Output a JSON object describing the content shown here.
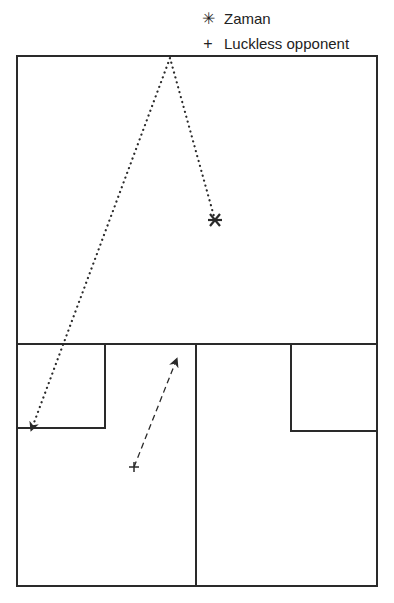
{
  "legend": {
    "items": [
      {
        "symbol": "✳",
        "label": "Zaman",
        "icon": "asterisk-icon"
      },
      {
        "symbol": "+",
        "label": "Luckless opponent",
        "icon": "plus-icon"
      }
    ]
  },
  "diagram": {
    "type": "squash-court-movement",
    "colors": {
      "line": "#2a2a2a",
      "background": "#ffffff"
    },
    "court": {
      "left": 17,
      "top": 56,
      "right": 377,
      "bottom": 586
    },
    "short_line_y": 344,
    "half_court_x": 196,
    "left_service_box": {
      "x1": 17,
      "x2": 105,
      "y1": 344,
      "y2": 428
    },
    "right_service_box": {
      "x1": 291,
      "x2": 377,
      "y1": 344,
      "y2": 431
    },
    "zaman": {
      "x": 215,
      "y": 220,
      "label": "Zaman"
    },
    "opponent": {
      "x": 134,
      "y": 467,
      "label": "Luckless opponent"
    },
    "ball_path": {
      "points": [
        [
          215,
          220
        ],
        [
          170,
          58
        ],
        [
          32,
          428
        ]
      ],
      "style": "dotted"
    },
    "opponent_path": {
      "from": [
        134,
        467
      ],
      "to": [
        176,
        361
      ],
      "style": "dashed"
    }
  }
}
